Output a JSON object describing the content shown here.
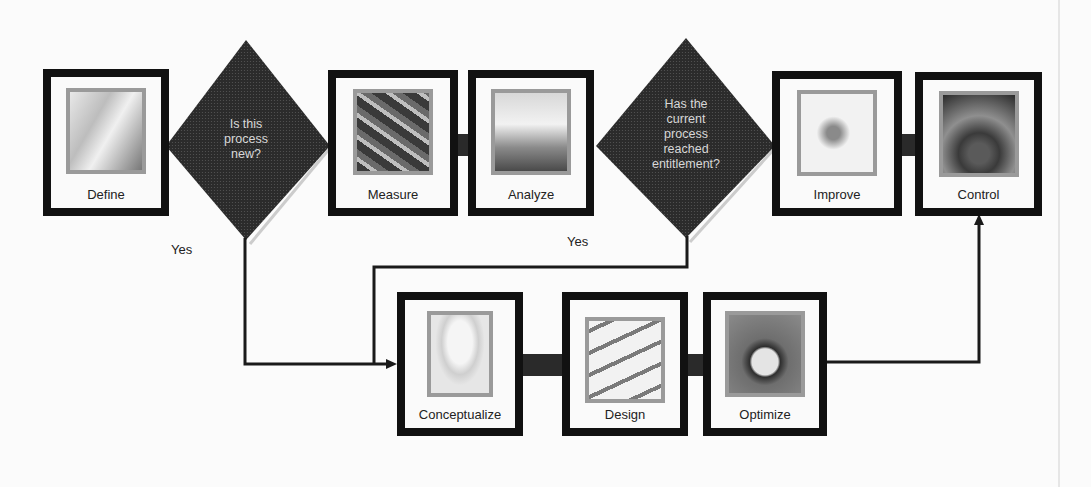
{
  "diagram": {
    "type": "flowchart",
    "title": "",
    "colors": {
      "box_border": "#111111",
      "diamond_fill": "#2b2b2b",
      "diamond_text": "#d8d8d8",
      "connector": "#1a1a1a",
      "background": "#fbfbfb",
      "image_frame": "#9a9a9a"
    },
    "top_row": {
      "define": {
        "label": "Define",
        "icon": "document-icon"
      },
      "decision1": {
        "lines": [
          "Is this",
          "process",
          "new?"
        ]
      },
      "measure": {
        "label": "Measure",
        "icon": "abacus-icon"
      },
      "analyze": {
        "label": "Analyze",
        "icon": "lab-flask-icon"
      },
      "decision2": {
        "lines": [
          "Has the",
          "current",
          "process",
          "reached",
          "entitlement?"
        ]
      },
      "improve": {
        "label": "Improve",
        "icon": "tools-icon"
      },
      "control": {
        "label": "Control",
        "icon": "control-panel-icon"
      }
    },
    "bottom_row": {
      "conceptualize": {
        "label": "Conceptualize",
        "icon": "lightbulb-icon"
      },
      "design": {
        "label": "Design",
        "icon": "drafting-tools-icon"
      },
      "optimize": {
        "label": "Optimize",
        "icon": "stopwatch-icon"
      }
    },
    "branch_labels": {
      "yes1": "Yes",
      "yes2": "Yes"
    },
    "edges": [
      {
        "from": "Define",
        "to": "Is this process new?"
      },
      {
        "from": "Is this process new?",
        "to": "Measure",
        "label": ""
      },
      {
        "from": "Is this process new?",
        "to": "Conceptualize",
        "label": "Yes"
      },
      {
        "from": "Measure",
        "to": "Analyze"
      },
      {
        "from": "Analyze",
        "to": "Has the current process reached entitlement?"
      },
      {
        "from": "Has the current process reached entitlement?",
        "to": "Improve",
        "label": ""
      },
      {
        "from": "Has the current process reached entitlement?",
        "to": "Conceptualize",
        "label": "Yes"
      },
      {
        "from": "Improve",
        "to": "Control"
      },
      {
        "from": "Conceptualize",
        "to": "Design"
      },
      {
        "from": "Design",
        "to": "Optimize"
      },
      {
        "from": "Optimize",
        "to": "Control"
      }
    ]
  }
}
